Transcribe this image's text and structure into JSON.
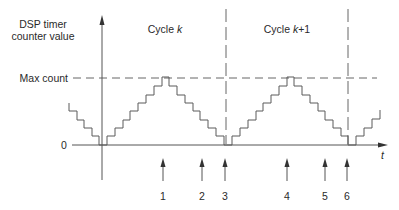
{
  "diagram": {
    "y_axis_label_line1": "DSP timer",
    "y_axis_label_line2": "counter value",
    "x_axis_label": "t",
    "zero_label": "0",
    "max_count_label": "Max count",
    "cycles": [
      {
        "prefix": "Cycle ",
        "var": "k"
      },
      {
        "prefix": "Cycle ",
        "var": "k",
        "suffix": "+1"
      }
    ],
    "markers": [
      {
        "label": "1"
      },
      {
        "label": "2"
      },
      {
        "label": "3"
      },
      {
        "label": "4"
      },
      {
        "label": "5"
      },
      {
        "label": "6"
      }
    ]
  }
}
